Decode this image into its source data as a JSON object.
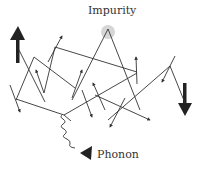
{
  "diagram": {
    "labels": {
      "impurity": "Impurity",
      "phonon": "Phonon"
    },
    "colors": {
      "line": "#333333",
      "impurity_halo": "#d0d0d0",
      "background": "#ffffff"
    },
    "icons": {
      "spin_up": "thick-up-arrow",
      "spin_down": "thick-down-arrow",
      "phonon": "wavy-arrow"
    },
    "path_points": [
      [
        18,
        97
      ],
      [
        34,
        56
      ],
      [
        75,
        87
      ],
      [
        108,
        30
      ],
      [
        153,
        108
      ],
      [
        137,
        59
      ],
      [
        55,
        47
      ],
      [
        45,
        93
      ],
      [
        7,
        87
      ],
      [
        3,
        69
      ]
    ]
  }
}
